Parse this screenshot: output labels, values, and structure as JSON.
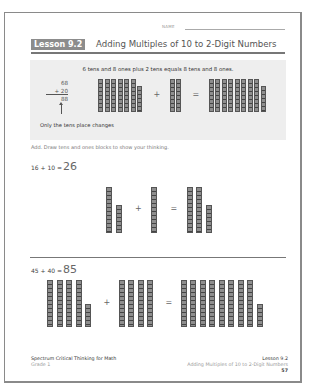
{
  "header": {
    "name_label": "NAME",
    "lesson_badge": "Lesson 9.2",
    "lesson_title": "Adding Multiples of 10 to 2-Digit Numbers"
  },
  "example": {
    "caption": "6 tens and 8 ones plus 2 tens equals 8 tens and 8 ones.",
    "addend1": "68",
    "addend2": "+ 20",
    "sum": "88",
    "note": "Only the tens place changes",
    "plus_sign": "+",
    "equals_sign": "=",
    "groups": [
      {
        "tens": 6,
        "ones": 8
      },
      {
        "tens": 2,
        "ones": 0
      },
      {
        "tens": 8,
        "ones": 8
      }
    ]
  },
  "instructions": "Add. Draw tens and ones blocks to show your thinking.",
  "problems": [
    {
      "equation": "16 + 10 =",
      "answer": "26",
      "plus_sign": "+",
      "equals_sign": "=",
      "groups": [
        {
          "tens": 1,
          "ones": 6
        },
        {
          "tens": 1,
          "ones": 0
        },
        {
          "tens": 2,
          "ones": 6
        }
      ]
    },
    {
      "equation": "45 + 40 =",
      "answer": "85",
      "plus_sign": "+",
      "equals_sign": "=",
      "groups": [
        {
          "tens": 4,
          "ones": 5
        },
        {
          "tens": 4,
          "ones": 0
        },
        {
          "tens": 8,
          "ones": 5
        }
      ]
    }
  ],
  "footer": {
    "book_title": "Spectrum Critical Thinking for Math",
    "grade": "Grade 1",
    "lesson": "Lesson 9.2",
    "lesson_title": "Adding Multiples of 10 to 2-Digit Numbers",
    "page_number": "57"
  }
}
